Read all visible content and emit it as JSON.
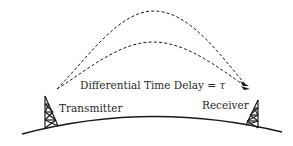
{
  "diagram": {
    "delay_label": "Differential Time Delay = ",
    "delay_symbol": "τ",
    "transmitter_label": "Transmitter",
    "receiver_label": "Receiver",
    "paths": [
      {
        "name": "upper-path",
        "style": "dashed"
      },
      {
        "name": "lower-path",
        "style": "dashed"
      }
    ],
    "colors": {
      "line": "#1a1a1a",
      "text": "#2a2a2a",
      "background": "#ffffff"
    }
  }
}
